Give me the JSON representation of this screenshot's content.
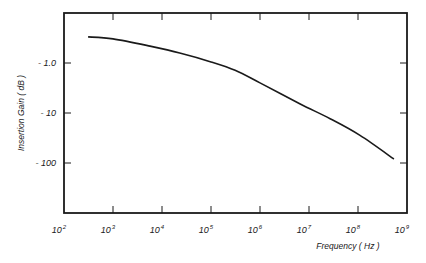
{
  "chart_data": {
    "type": "line",
    "title": "",
    "xlabel": "Frequency  ( Hz )",
    "ylabel": "Insertion  Gain  ( dB )",
    "x_scale": "log",
    "y_scale": "log-magnitude (negative dB)",
    "xlim": [
      100,
      1000000000
    ],
    "ylim": [
      -0.1,
      -1000
    ],
    "grid": false,
    "legend": null,
    "x_ticks": [
      {
        "base": "10",
        "exp": "2",
        "value": 100
      },
      {
        "base": "10",
        "exp": "3",
        "value": 1000
      },
      {
        "base": "10",
        "exp": "4",
        "value": 10000
      },
      {
        "base": "10",
        "exp": "5",
        "value": 100000
      },
      {
        "base": "10",
        "exp": "6",
        "value": 1000000
      },
      {
        "base": "10",
        "exp": "7",
        "value": 10000000
      },
      {
        "base": "10",
        "exp": "8",
        "value": 100000000
      },
      {
        "base": "10",
        "exp": "9",
        "value": 1000000000
      }
    ],
    "y_ticks": [
      {
        "label": "- 1.0",
        "value": -1.0
      },
      {
        "label": "- 10",
        "value": -10
      },
      {
        "label": "- 100",
        "value": -100
      }
    ],
    "series": [
      {
        "name": "Insertion Gain",
        "x": [
          310,
          1000,
          5700,
          23000,
          100000,
          310000,
          1000000,
          6600000,
          27000000,
          110000000,
          540000000
        ],
        "y": [
          -0.3,
          -0.33,
          -0.46,
          -0.63,
          -0.95,
          -1.4,
          -2.5,
          -6.6,
          -13,
          -28,
          -83
        ]
      }
    ]
  },
  "style": {
    "line_color": "#1a1a1a",
    "frame_color": "#1a1a1a"
  }
}
